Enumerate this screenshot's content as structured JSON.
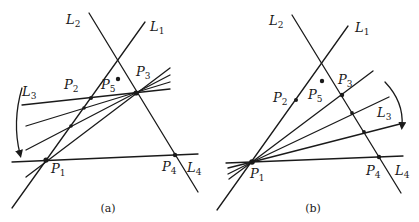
{
  "figure": {
    "panels": [
      {
        "id": "a",
        "caption": "(a)",
        "labels": {
          "L1": {
            "base": "L",
            "sub": "1"
          },
          "L2": {
            "base": "L",
            "sub": "2"
          },
          "L3": {
            "base": "L",
            "sub": "3"
          },
          "L4": {
            "base": "L",
            "sub": "4"
          },
          "P1": {
            "base": "P",
            "sub": "1"
          },
          "P2": {
            "base": "P",
            "sub": "2"
          },
          "P3": {
            "base": "P",
            "sub": "3"
          },
          "P4": {
            "base": "P",
            "sub": "4"
          },
          "P5": {
            "base": "P",
            "sub": "5"
          }
        },
        "description": "Line L3 rotates about P3, sweeping from P2 toward P1"
      },
      {
        "id": "b",
        "caption": "(b)",
        "labels": {
          "L1": {
            "base": "L",
            "sub": "1"
          },
          "L2": {
            "base": "L",
            "sub": "2"
          },
          "L3": {
            "base": "L",
            "sub": "3"
          },
          "L4": {
            "base": "L",
            "sub": "4"
          },
          "P1": {
            "base": "P",
            "sub": "1"
          },
          "P2": {
            "base": "P",
            "sub": "2"
          },
          "P3": {
            "base": "P",
            "sub": "3"
          },
          "P4": {
            "base": "P",
            "sub": "4"
          },
          "P5": {
            "base": "P",
            "sub": "5"
          }
        },
        "description": "Line L3 rotates about P1, sweeping from P3 toward P4"
      }
    ]
  }
}
